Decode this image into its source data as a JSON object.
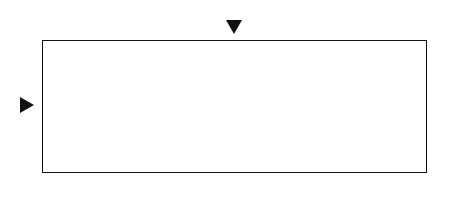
{
  "chart": {
    "columns": 21,
    "rows": 7,
    "col_labels_top": [
      {
        "col": 1,
        "text": "1"
      },
      {
        "col": 10,
        "text": "10"
      },
      {
        "col": 20,
        "text": "20"
      },
      {
        "col": 21,
        "text": "21"
      }
    ],
    "col_labels_bottom": [
      {
        "col": 1,
        "text": "1"
      },
      {
        "col": 10,
        "text": "10"
      },
      {
        "col": 20,
        "text": "20"
      },
      {
        "col": 21,
        "text": "21"
      }
    ],
    "row_labels_left": [
      {
        "row": 1,
        "text": "1"
      },
      {
        "row": 7,
        "text": "7"
      }
    ],
    "row_labels_right": [
      {
        "row": 1,
        "text": "1"
      },
      {
        "row": 7,
        "text": "7"
      }
    ],
    "markers": {
      "column_marker": 11,
      "row_marker": 4
    },
    "symbols_legend": {
      "tri": "triangle",
      "sq": "filled-square",
      "x": "cross",
      "ring": "double-circle"
    },
    "cells": [
      {
        "r": 1,
        "c": 10,
        "s": "tri"
      },
      {
        "r": 1,
        "c": 12,
        "s": "tri"
      },
      {
        "r": 1,
        "c": 14,
        "s": "tri"
      },
      {
        "r": 1,
        "c": 16,
        "s": "tri"
      },
      {
        "r": 1,
        "c": 18,
        "s": "tri"
      },
      {
        "r": 2,
        "c": 7,
        "s": "tri"
      },
      {
        "r": 2,
        "c": 9,
        "s": "sq"
      },
      {
        "r": 2,
        "c": 10,
        "s": "x"
      },
      {
        "r": 2,
        "c": 11,
        "s": "sq"
      },
      {
        "r": 2,
        "c": 12,
        "s": "x"
      },
      {
        "r": 2,
        "c": 13,
        "s": "sq"
      },
      {
        "r": 2,
        "c": 14,
        "s": "x"
      },
      {
        "r": 2,
        "c": 15,
        "s": "sq"
      },
      {
        "r": 2,
        "c": 16,
        "s": "x"
      },
      {
        "r": 2,
        "c": 17,
        "s": "sq"
      },
      {
        "r": 2,
        "c": 18,
        "s": "x"
      },
      {
        "r": 2,
        "c": 19,
        "s": "x"
      },
      {
        "r": 2,
        "c": 20,
        "s": "x"
      },
      {
        "r": 3,
        "c": 3,
        "s": "tri"
      },
      {
        "r": 3,
        "c": 5,
        "s": "tri"
      },
      {
        "r": 3,
        "c": 8,
        "s": "x"
      },
      {
        "r": 3,
        "c": 9,
        "s": "sq"
      },
      {
        "r": 3,
        "c": 10,
        "s": "x"
      },
      {
        "r": 3,
        "c": 11,
        "s": "sq"
      },
      {
        "r": 3,
        "c": 12,
        "s": "x"
      },
      {
        "r": 3,
        "c": 13,
        "s": "sq"
      },
      {
        "r": 3,
        "c": 14,
        "s": "x"
      },
      {
        "r": 3,
        "c": 15,
        "s": "sq"
      },
      {
        "r": 3,
        "c": 16,
        "s": "x"
      },
      {
        "r": 3,
        "c": 17,
        "s": "sq"
      },
      {
        "r": 3,
        "c": 18,
        "s": "x"
      },
      {
        "r": 3,
        "c": 19,
        "s": "ring"
      },
      {
        "r": 3,
        "c": 20,
        "s": "x"
      },
      {
        "r": 3,
        "c": 21,
        "s": "x"
      },
      {
        "r": 4,
        "c": 3,
        "s": "sq"
      },
      {
        "r": 4,
        "c": 4,
        "s": "x"
      },
      {
        "r": 4,
        "c": 5,
        "s": "sq"
      },
      {
        "r": 4,
        "c": 6,
        "s": "x"
      },
      {
        "r": 4,
        "c": 7,
        "s": "sq"
      },
      {
        "r": 4,
        "c": 8,
        "s": "x"
      },
      {
        "r": 4,
        "c": 9,
        "s": "sq"
      },
      {
        "r": 4,
        "c": 10,
        "s": "x"
      },
      {
        "r": 4,
        "c": 11,
        "s": "sq"
      },
      {
        "r": 4,
        "c": 12,
        "s": "x"
      },
      {
        "r": 4,
        "c": 13,
        "s": "sq"
      },
      {
        "r": 4,
        "c": 14,
        "s": "x"
      },
      {
        "r": 4,
        "c": 15,
        "s": "sq"
      },
      {
        "r": 4,
        "c": 16,
        "s": "x"
      },
      {
        "r": 4,
        "c": 17,
        "s": "sq"
      },
      {
        "r": 4,
        "c": 18,
        "s": "x"
      },
      {
        "r": 4,
        "c": 19,
        "s": "x"
      },
      {
        "r": 4,
        "c": 20,
        "s": "x"
      },
      {
        "r": 4,
        "c": 21,
        "s": "x"
      },
      {
        "r": 5,
        "c": 2,
        "s": "x"
      },
      {
        "r": 5,
        "c": 11,
        "s": "x"
      },
      {
        "r": 5,
        "c": 17,
        "s": "x"
      },
      {
        "r": 6,
        "c": 1,
        "s": "sq"
      },
      {
        "r": 6,
        "c": 11,
        "s": "x"
      },
      {
        "r": 6,
        "c": 12,
        "s": "x"
      },
      {
        "r": 6,
        "c": 17,
        "s": "x"
      },
      {
        "r": 6,
        "c": 18,
        "s": "x"
      },
      {
        "r": 7,
        "c": 1,
        "s": "x"
      }
    ]
  },
  "glyphs": {
    "x": "×"
  }
}
